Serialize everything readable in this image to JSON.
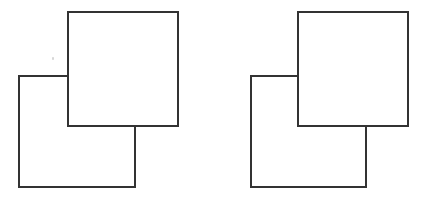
{
  "canvas": {
    "width": 431,
    "height": 201,
    "background_color": "#ffffff",
    "description": "Two side-by-side line drawings, each showing two overlapping squares"
  },
  "style": {
    "stroke_color": "#333333",
    "stroke_width": 2,
    "fill_color": "#ffffff"
  },
  "figures": [
    {
      "id": "figure-left",
      "name": "left-overlapping-squares",
      "label": "",
      "shapes": [
        {
          "id": "left-lower-square",
          "name": "lower-left-square",
          "type": "square",
          "x": 18,
          "y": 75,
          "width": 118,
          "height": 113,
          "z": 1,
          "occluded": true
        },
        {
          "id": "left-upper-square",
          "name": "upper-right-square",
          "type": "square",
          "x": 67,
          "y": 11,
          "width": 112,
          "height": 116,
          "z": 2,
          "occluded": false
        }
      ],
      "overlap_region": {
        "x": 67,
        "y": 75,
        "width": 69,
        "height": 52
      }
    },
    {
      "id": "figure-right",
      "name": "right-overlapping-squares",
      "label": "",
      "shapes": [
        {
          "id": "right-lower-square",
          "name": "lower-left-square",
          "type": "square",
          "x": 250,
          "y": 75,
          "width": 117,
          "height": 113,
          "z": 1,
          "occluded": true
        },
        {
          "id": "right-upper-square",
          "name": "upper-right-square",
          "type": "square",
          "x": 297,
          "y": 11,
          "width": 112,
          "height": 116,
          "z": 2,
          "occluded": false
        }
      ],
      "overlap_region": {
        "x": 297,
        "y": 75,
        "width": 70,
        "height": 52
      }
    }
  ],
  "artifacts": [
    {
      "id": "scan-speck",
      "name": "scan-speck",
      "x": 52,
      "y": 57,
      "color": "#c9c9c9"
    }
  ]
}
